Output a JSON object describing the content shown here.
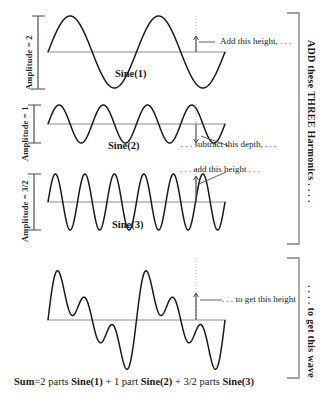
{
  "figure": {
    "background_color": "#ffffff",
    "curve_color": "#1a1a1a",
    "axis_color": "#8c8c8c",
    "guide_color": "#b3b3b3"
  },
  "panels": [
    {
      "id": "sine1",
      "amplitude_label": "Amplitude = 2",
      "name_label": "Sine(1)",
      "cycles": 2,
      "amplitude": 2
    },
    {
      "id": "sine2",
      "amplitude_label": "Amplitude = 1",
      "name_label": "Sine(2)",
      "cycles": 4,
      "amplitude": 1
    },
    {
      "id": "sine3",
      "amplitude_label": "Amplitude = 3/2",
      "name_label": "Sine(3)",
      "cycles": 6,
      "amplitude": 1.5
    },
    {
      "id": "sum",
      "amplitude_label": "",
      "name_label": "",
      "cycles": 1,
      "amplitude": 4.5
    }
  ],
  "annotations": {
    "add_this_height": "Add this height, . . .",
    "subtract_this_depth": ". . . subtract this depth, . . .",
    "add_this_height_3": ". . . add this height . . .",
    "to_get_this_height": ". . . to get this height"
  },
  "brackets": {
    "top_label": "ADD  these  THREE  Harmonics . . . .",
    "bottom_label": ". . . . to get this wave"
  },
  "sum_equation": {
    "prefix": "Sum",
    "parts": [
      {
        "coefficient": "=2 parts ",
        "term": "Sine(1)"
      },
      {
        "coefficient": " +  1 part ",
        "term": "Sine(2)"
      },
      {
        "coefficient": " +  3/2 parts ",
        "term": "Sine(3)"
      }
    ],
    "full_text": "Sum =2 parts Sine(1)  +  1 part Sine(2)  +  3/2 parts Sine(3)"
  },
  "chart_data": {
    "type": "line",
    "xlabel": "",
    "ylabel": "",
    "grid": false,
    "legend_position": "none",
    "x_range": [
      0,
      12.566
    ],
    "marker_x": 8.168,
    "series": [
      {
        "name": "Sine(1)",
        "formula": "2*sin(x)",
        "amplitude": 2,
        "frequency": 1,
        "cycles": 2,
        "value_at_marker": 1.05
      },
      {
        "name": "Sine(2)",
        "formula": "1*sin(2x)",
        "amplitude": 1,
        "frequency": 2,
        "cycles": 4,
        "value_at_marker": -0.98
      },
      {
        "name": "Sine(3)",
        "formula": "1.5*sin(3x)",
        "amplitude": 1.5,
        "frequency": 3,
        "cycles": 6,
        "value_at_marker": 1.42
      },
      {
        "name": "Sum",
        "formula": "2*sin(x) + 1*sin(2x) + 1.5*sin(3x)",
        "amplitude": 4.5,
        "frequency": 1,
        "cycles": 2,
        "value_at_marker": 1.49
      }
    ]
  }
}
